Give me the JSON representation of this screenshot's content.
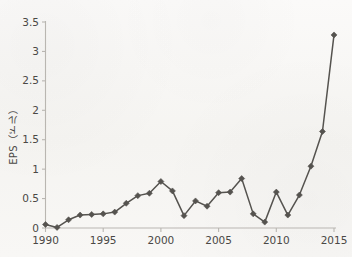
{
  "chart_data": {
    "type": "line",
    "title": "",
    "xlabel": "",
    "ylabel": "EPS（ドル）",
    "ylabel_parts": {
      "metric": "EPS",
      "unit": "（ドル）"
    },
    "xlim": [
      1990,
      2015
    ],
    "ylim": [
      0,
      3.5
    ],
    "grid": false,
    "legend": null,
    "xticks": [
      1990,
      1995,
      2000,
      2005,
      2010,
      2015
    ],
    "xtick_labels": [
      "1990",
      "1995",
      "2000",
      "2005",
      "2010",
      "2015"
    ],
    "yticks": [
      0,
      0.5,
      1,
      1.5,
      2,
      2.5,
      3,
      3.5
    ],
    "ytick_labels": [
      "0",
      "0.5",
      "1",
      "1.5",
      "2",
      "2.5",
      "3",
      "3.5"
    ],
    "x": [
      1990,
      1991,
      1992,
      1993,
      1994,
      1995,
      1996,
      1997,
      1998,
      1999,
      2000,
      2001,
      2002,
      2003,
      2004,
      2005,
      2006,
      2007,
      2008,
      2009,
      2010,
      2011,
      2012,
      2013,
      2014,
      2015
    ],
    "values": [
      0.06,
      0.01,
      0.14,
      0.22,
      0.23,
      0.24,
      0.27,
      0.42,
      0.55,
      0.59,
      0.79,
      0.63,
      0.21,
      0.46,
      0.37,
      0.6,
      0.61,
      0.84,
      0.24,
      0.1,
      0.61,
      0.22,
      0.56,
      1.05,
      1.64,
      3.28
    ],
    "series": [
      {
        "name": "EPS",
        "color": "#55534f",
        "marker": "diamond",
        "values": [
          0.06,
          0.01,
          0.14,
          0.22,
          0.23,
          0.24,
          0.27,
          0.42,
          0.55,
          0.59,
          0.79,
          0.63,
          0.21,
          0.46,
          0.37,
          0.6,
          0.61,
          0.84,
          0.24,
          0.1,
          0.61,
          0.22,
          0.56,
          1.05,
          1.64,
          3.28
        ]
      }
    ],
    "colors": {
      "series": "#55534f",
      "axis": "#b9b6b1",
      "text": "#4a4845",
      "background": "#f7f6f4"
    }
  }
}
